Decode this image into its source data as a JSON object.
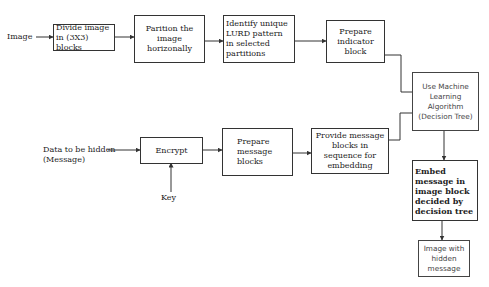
{
  "diagram": {
    "inputs": {
      "image": "Image",
      "message_line1": "Data to be hidden",
      "message_line2": "(Message)",
      "key": "Key"
    },
    "nodes": {
      "divide": "Divide image in (3X3) blocks",
      "partition": "Parition the image horizonally",
      "identify": "Identify unique LURD pattern in selected partitions",
      "indicator": "Prepare indicator block",
      "ml": "Use Machine Learning Algorithm (Decision Tree)",
      "encrypt": "Encrypt",
      "prepare_message": "Prepare message blocks",
      "provide": "Provide message blocks in sequence for embedding",
      "embed": "Embed message in image block decided by decision tree",
      "output": "Image with hidden message"
    },
    "edges": [
      [
        "Image",
        "Divide image in (3X3) blocks"
      ],
      [
        "Divide image in (3X3) blocks",
        "Parition the image horizonally"
      ],
      [
        "Parition the image horizonally",
        "Identify unique LURD pattern in selected partitions"
      ],
      [
        "Identify unique LURD pattern in selected partitions",
        "Prepare indicator block"
      ],
      [
        "Prepare indicator block",
        "Use Machine Learning Algorithm (Decision Tree)"
      ],
      [
        "Data to be hidden (Message)",
        "Encrypt"
      ],
      [
        "Key",
        "Encrypt"
      ],
      [
        "Encrypt",
        "Prepare message blocks"
      ],
      [
        "Prepare message blocks",
        "Provide message blocks in sequence for embedding"
      ],
      [
        "Provide message blocks in sequence for embedding",
        "Use Machine Learning Algorithm (Decision Tree)"
      ],
      [
        "Use Machine Learning Algorithm (Decision Tree)",
        "Embed message in image block decided by decision tree"
      ],
      [
        "Embed message in image block decided by decision tree",
        "Image with hidden message"
      ]
    ]
  }
}
